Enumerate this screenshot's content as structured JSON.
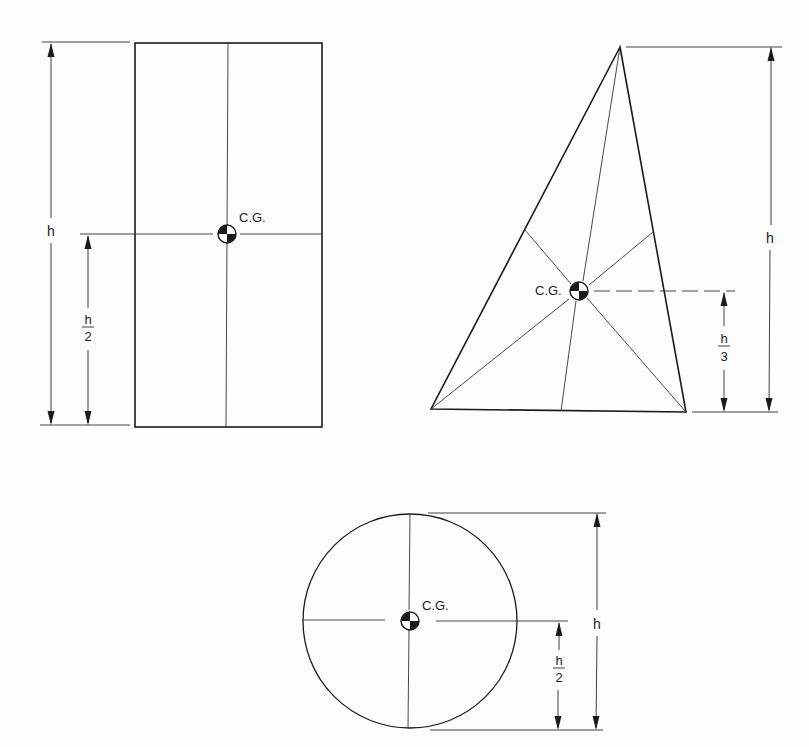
{
  "figures": [
    {
      "id": "rectangle",
      "shape": "rectangle",
      "cg_label": "C.G.",
      "height_label": "h",
      "cg_height_label": {
        "numerator": "h",
        "denominator": "2"
      },
      "cg_fraction": "h/2"
    },
    {
      "id": "triangle",
      "shape": "triangle",
      "cg_label": "C.G.",
      "height_label": "h",
      "cg_height_label": {
        "numerator": "h",
        "denominator": "3"
      },
      "cg_fraction": "h/3"
    },
    {
      "id": "circle",
      "shape": "circle",
      "cg_label": "C.G.",
      "height_label": "h",
      "cg_height_label": {
        "numerator": "h",
        "denominator": "2"
      },
      "cg_fraction": "h/2"
    }
  ],
  "colors": {
    "line": "#1a1a1a",
    "background": "#fdfdfd"
  }
}
